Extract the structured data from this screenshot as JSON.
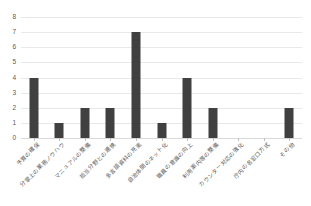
{
  "chart_data": {
    "type": "bar",
    "title": "",
    "subtitle": "",
    "xlabel": "",
    "ylabel": "",
    "ylim": [
      0,
      8
    ],
    "ytick_step": 1,
    "yticks": [
      "8",
      "7",
      "6",
      "5",
      "4",
      "3",
      "2",
      "1",
      "0"
    ],
    "grid": true,
    "grid_axis": "y",
    "legend": false,
    "legend_position": "none",
    "bar_color": "#404040",
    "gridline_color": "#e8e8e8",
    "axis_text_color": "#595959",
    "categories": [
      "予算の確保",
      "分掌上の業務ノウハウ",
      "マニュアルの整備",
      "担当分野との連携",
      "多言語資料の充実",
      "自治体間のネット化",
      "職員の意識の向上",
      "利用案内等の整備",
      "カウンター対応の強化",
      "庁内の各窓口方式",
      "その他"
    ],
    "values": [
      4,
      1,
      2,
      2,
      7,
      1,
      4,
      2,
      0,
      0,
      2
    ]
  }
}
